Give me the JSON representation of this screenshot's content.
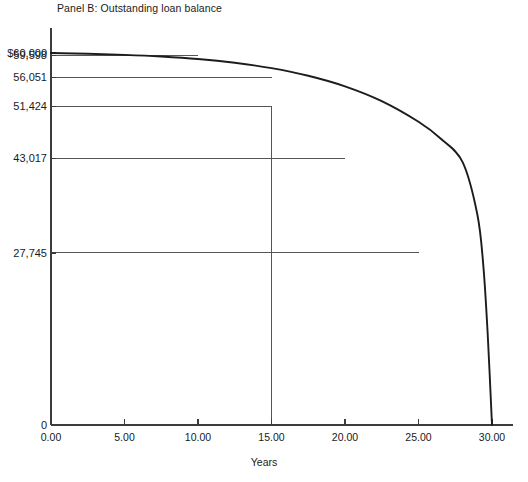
{
  "chart_data": {
    "type": "line",
    "title": "Panel B: Outstanding loan balance",
    "xlabel": "Years",
    "ylabel": "",
    "xlim": [
      0,
      30
    ],
    "ylim": [
      0,
      60000
    ],
    "grid": false,
    "legend": null,
    "x_ticks": [
      {
        "value": 0,
        "label": "0.00"
      },
      {
        "value": 5,
        "label": "5.00"
      },
      {
        "value": 10,
        "label": "10.00"
      },
      {
        "value": 15,
        "label": "15.00"
      },
      {
        "value": 20,
        "label": "20.00"
      },
      {
        "value": 25,
        "label": "25.00"
      },
      {
        "value": 30,
        "label": "30.00"
      }
    ],
    "y_ticks": [
      {
        "value": 60000,
        "label": "$60,000"
      },
      {
        "value": 59598,
        "label": "59,598"
      },
      {
        "value": 56051,
        "label": "56,051"
      },
      {
        "value": 51424,
        "label": "51,424"
      },
      {
        "value": 43017,
        "label": "43,017"
      },
      {
        "value": 27745,
        "label": "27,745"
      },
      {
        "value": 0,
        "label": "0"
      }
    ],
    "series": [
      {
        "name": "Outstanding loan balance",
        "x": [
          0,
          1,
          2,
          3,
          4,
          5,
          6,
          7,
          8,
          9,
          10,
          11,
          12,
          13,
          14,
          15,
          16,
          17,
          18,
          19,
          20,
          21,
          22,
          23,
          24,
          25,
          26,
          27,
          28,
          29,
          30
        ],
        "values": [
          60000,
          59911,
          59814,
          59707,
          59590,
          59461,
          59319,
          59163,
          58992,
          58804,
          59598,
          58367,
          58121,
          57850,
          57553,
          56051,
          56862,
          56465,
          56029,
          55550,
          43017,
          54452,
          53820,
          53125,
          52361,
          27745,
          50600,
          49589,
          48477,
          47255,
          0
        ]
      }
    ],
    "annotations": [
      {
        "kind": "reference-line",
        "orientation": "horizontal",
        "y_value": 59598,
        "x_from": 0,
        "x_to": 10,
        "label": "59,598"
      },
      {
        "kind": "reference-line",
        "orientation": "horizontal",
        "y_value": 56051,
        "x_from": 0,
        "x_to": 15,
        "label": "56,051"
      },
      {
        "kind": "reference-line",
        "orientation": "horizontal",
        "y_value": 51424,
        "x_from": 0,
        "x_to": 15,
        "label": "51,424"
      },
      {
        "kind": "reference-line",
        "orientation": "horizontal",
        "y_value": 43017,
        "x_from": 0,
        "x_to": 20,
        "label": "43,017"
      },
      {
        "kind": "reference-line",
        "orientation": "horizontal",
        "y_value": 27745,
        "x_from": 0,
        "x_to": 25,
        "label": "27,745"
      },
      {
        "kind": "reference-line",
        "orientation": "vertical",
        "x_value": 15,
        "y_from": 0,
        "y_to": 51424,
        "label": "15.00"
      }
    ],
    "curve_points": [
      {
        "x": 0,
        "y": 60000
      },
      {
        "x": 2.5,
        "y": 59880
      },
      {
        "x": 5,
        "y": 59700
      },
      {
        "x": 7.5,
        "y": 59430
      },
      {
        "x": 10,
        "y": 59030
      },
      {
        "x": 12.5,
        "y": 58420
      },
      {
        "x": 15,
        "y": 57560
      },
      {
        "x": 17.5,
        "y": 56330
      },
      {
        "x": 20,
        "y": 54620
      },
      {
        "x": 22.5,
        "y": 52230
      },
      {
        "x": 25,
        "y": 48900
      },
      {
        "x": 26.5,
        "y": 46200
      },
      {
        "x": 28,
        "y": 42400
      },
      {
        "x": 29,
        "y": 34000
      },
      {
        "x": 29.4,
        "y": 26000
      },
      {
        "x": 29.7,
        "y": 15000
      },
      {
        "x": 30,
        "y": 0
      }
    ],
    "geometry": {
      "x_pixel_min": 51,
      "x_pixel_max": 492,
      "y_pixel_zero": 425,
      "y_pixel_max": 53,
      "y_axis_top": 28,
      "x_axis_right": 513
    },
    "colors": {
      "curve": "#1c1c1c",
      "axis": "#3c3c3c",
      "reference_line": "#555555",
      "background": "#ffffff",
      "text": "#1a1a1a"
    }
  }
}
